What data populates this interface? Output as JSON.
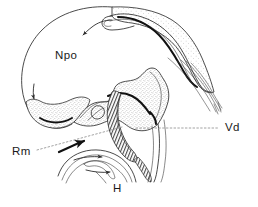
{
  "figure": {
    "background_color": "#ffffff",
    "ink_color": "#2b2b2b",
    "leader_color": "#8a8a8a",
    "width": 258,
    "height": 207
  },
  "labels": [
    {
      "id": "npo",
      "text": "Npo",
      "x": 55,
      "y": 59,
      "has_leader": false
    },
    {
      "id": "vd",
      "text": "Vd",
      "x": 225,
      "y": 131,
      "has_leader": true
    },
    {
      "id": "rm",
      "text": "Rm",
      "x": 12,
      "y": 155,
      "has_leader": true
    },
    {
      "id": "h",
      "text": "H",
      "x": 113,
      "y": 192,
      "has_leader": false
    }
  ],
  "leaders": [
    {
      "id": "vd-leader",
      "from_x": 136,
      "from_y": 128,
      "to_x": 218,
      "to_y": 128
    },
    {
      "id": "rm-leader",
      "from_x": 37,
      "from_y": 150,
      "to_x": 122,
      "to_y": 127
    }
  ],
  "arrows": [
    {
      "id": "npo-arrow",
      "style": "thin",
      "description": "curved thin arrow pointing down-left in upper region"
    },
    {
      "id": "rm-arrow",
      "style": "bold",
      "description": "bold arrow pointing up-right near Rm label"
    },
    {
      "id": "left-arrow",
      "style": "thin",
      "description": "short thin arrow at left margin of oval"
    },
    {
      "id": "h-arrow-upper",
      "style": "thin",
      "description": "thin arrow pointing right within lower fold"
    },
    {
      "id": "h-arrow-lower",
      "style": "thin",
      "description": "thin arrow pointing right-down within lower fold"
    }
  ],
  "structures": [
    {
      "id": "npo-body",
      "name": "Npo oval body",
      "shading": "stippled-lower"
    },
    {
      "id": "dorsal-arc",
      "name": "dorsal curved arc with stipple",
      "shading": "stippled"
    },
    {
      "id": "central-folds",
      "name": "central folded lamina",
      "shading": "stippled"
    },
    {
      "id": "hatched-band",
      "name": "hatched U-shaped band",
      "shading": "hatched"
    },
    {
      "id": "fiber-fan",
      "name": "fanning fiber bundle",
      "shading": "none"
    },
    {
      "id": "lower-folds",
      "name": "H lower folded layers",
      "shading": "none"
    }
  ]
}
